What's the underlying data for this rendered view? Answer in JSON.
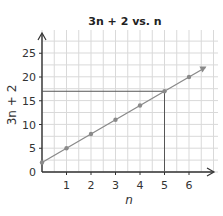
{
  "chart_data": {
    "type": "line",
    "title": "3n + 2 vs. n",
    "xlabel": "n",
    "ylabel": "3n + 2",
    "x": [
      0,
      1,
      2,
      3,
      4,
      5,
      6,
      6.67
    ],
    "series": [
      {
        "name": "3n + 2",
        "values": [
          2,
          5,
          8,
          11,
          14,
          17,
          20,
          22
        ]
      }
    ],
    "x_ticks": [
      1,
      2,
      3,
      4,
      5,
      6
    ],
    "y_ticks": [
      0,
      5,
      10,
      15,
      20,
      25
    ],
    "xlim": [
      0,
      7
    ],
    "ylim": [
      0,
      28
    ],
    "grid": true,
    "annotations": [
      {
        "type": "guide-lines",
        "x": 5,
        "y": 17,
        "description": "Vertical line at n = 5 and horizontal line at 3n + 2 = 17 meeting on the line"
      }
    ],
    "colors": {
      "line": "#8a8a8a",
      "point": "#8a8a8a",
      "grid": "#d9d9d9",
      "axis": "#333333",
      "guide": "#555555"
    }
  }
}
